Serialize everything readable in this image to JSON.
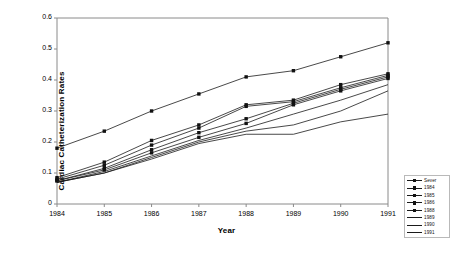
{
  "chart_data": {
    "type": "line",
    "title": "",
    "xlabel": "Year",
    "ylabel": "Cardiac Catheterization Rates",
    "x": [
      1984,
      1985,
      1986,
      1987,
      1988,
      1989,
      1990,
      1991
    ],
    "xtick_labels": [
      "1984",
      "1985",
      "1986",
      "1987",
      "1988",
      "1989",
      "1990",
      "1991"
    ],
    "ytick_labels": [
      "0",
      "0.1",
      "0.2",
      "0.3",
      "0.4",
      "0.5",
      "0.6"
    ],
    "ytick_values": [
      0,
      0.1,
      0.2,
      0.3,
      0.4,
      0.5,
      0.6
    ],
    "xlim": [
      1984,
      1991
    ],
    "ylim": [
      0,
      0.6
    ],
    "grid": false,
    "legend_position": "right-bottom-outside",
    "series": [
      {
        "name": "Sever",
        "marker": "square",
        "values": [
          0.18,
          0.235,
          0.3,
          0.355,
          0.41,
          0.43,
          0.475,
          0.52
        ]
      },
      {
        "name": "1984",
        "marker": "square",
        "values": [
          0.085,
          0.135,
          0.205,
          0.255,
          0.32,
          0.335,
          0.385,
          0.42
        ]
      },
      {
        "name": "1985",
        "marker": "square",
        "values": [
          0.08,
          0.125,
          0.19,
          0.245,
          0.315,
          0.33,
          0.375,
          0.415
        ]
      },
      {
        "name": "1986",
        "marker": "square",
        "values": [
          0.075,
          0.115,
          0.175,
          0.23,
          0.275,
          0.325,
          0.37,
          0.41
        ]
      },
      {
        "name": "1988",
        "marker": "square",
        "values": [
          0.075,
          0.11,
          0.165,
          0.215,
          0.26,
          0.32,
          0.365,
          0.405
        ]
      },
      {
        "name": "1989",
        "marker": "line",
        "values": [
          0.07,
          0.105,
          0.155,
          0.205,
          0.245,
          0.29,
          0.335,
          0.385
        ]
      },
      {
        "name": "1990",
        "marker": "line",
        "values": [
          0.07,
          0.1,
          0.15,
          0.2,
          0.235,
          0.255,
          0.3,
          0.365
        ]
      },
      {
        "name": "1991",
        "marker": "line",
        "values": [
          0.07,
          0.1,
          0.145,
          0.195,
          0.225,
          0.225,
          0.265,
          0.29
        ]
      }
    ]
  },
  "style": {
    "line_color": "#1a1a1a",
    "axis_color": "#8a8a8a",
    "marker_color": "#111111",
    "legend_border": "#b9b9b9"
  }
}
